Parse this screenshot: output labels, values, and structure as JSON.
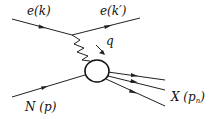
{
  "diagram": {
    "labels": {
      "incoming_electron": "e(k)",
      "outgoing_electron": "e(k′)",
      "photon": "q",
      "nucleon": "N (p)",
      "final_state": "X (p",
      "final_state_sub": "n",
      "final_state_close": ")"
    },
    "colors": {
      "line": "#222222",
      "background": "#ffffff"
    }
  }
}
